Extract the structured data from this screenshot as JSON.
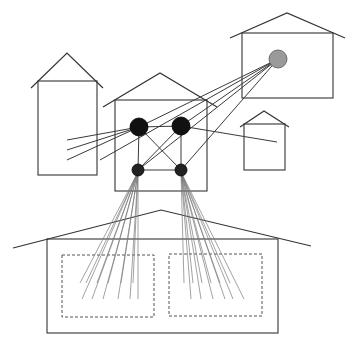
{
  "diagram": {
    "title": "Houses connected through a network hub",
    "colors": {
      "background": "#ffffff",
      "outline": "#333333",
      "link": "#3a3a3a",
      "fan": "#7a7a7a",
      "node_dark": "#111111",
      "node_small": "#222222",
      "node_gray": "#9a9a9a",
      "dashed": "#555555"
    },
    "houses": [
      {
        "id": "house-left-tall",
        "roof": [
          [
            31,
            88
          ],
          [
            67,
            53
          ],
          [
            103,
            88
          ]
        ],
        "body": {
          "x": 38,
          "y": 81,
          "w": 59,
          "h": 94
        }
      },
      {
        "id": "house-center-hub",
        "roof": [
          [
            103,
            107
          ],
          [
            160,
            73
          ],
          [
            217,
            107
          ]
        ],
        "body": {
          "x": 115,
          "y": 100,
          "w": 92,
          "h": 91
        }
      },
      {
        "id": "house-top-right",
        "roof": [
          [
            230,
            38
          ],
          [
            287,
            13
          ],
          [
            345,
            38
          ]
        ],
        "body": {
          "x": 242,
          "y": 33,
          "w": 91,
          "h": 65
        }
      },
      {
        "id": "house-small-right",
        "roof": [
          [
            240,
            127
          ],
          [
            264,
            111
          ],
          [
            289,
            127
          ]
        ],
        "body": {
          "x": 244,
          "y": 124,
          "w": 41,
          "h": 46
        }
      },
      {
        "id": "house-bottom-large",
        "roof": [
          [
            13,
            248
          ],
          [
            161,
            210
          ],
          [
            311,
            246
          ]
        ],
        "body": {
          "x": 47,
          "y": 239,
          "w": 231,
          "h": 94
        }
      }
    ],
    "rooms": [
      {
        "id": "room-left",
        "x": 62,
        "y": 255,
        "w": 92,
        "h": 62
      },
      {
        "id": "room-right",
        "x": 169,
        "y": 254,
        "w": 93,
        "h": 62
      }
    ],
    "nodes": [
      {
        "id": "hub-top-left",
        "cx": 139,
        "cy": 127,
        "r": 9,
        "kind": "dark"
      },
      {
        "id": "hub-top-right",
        "cx": 181,
        "cy": 126,
        "r": 9,
        "kind": "dark"
      },
      {
        "id": "hub-bottom-left",
        "cx": 138,
        "cy": 170,
        "r": 6,
        "kind": "small"
      },
      {
        "id": "hub-bottom-right",
        "cx": 181,
        "cy": 170,
        "r": 6,
        "kind": "small"
      },
      {
        "id": "remote-gray",
        "cx": 278,
        "cy": 59,
        "r": 9,
        "kind": "gray"
      }
    ],
    "links": [
      {
        "from": [
          139,
          127
        ],
        "to": [
          181,
          126
        ]
      },
      {
        "from": [
          139,
          127
        ],
        "to": [
          138,
          170
        ]
      },
      {
        "from": [
          181,
          126
        ],
        "to": [
          181,
          170
        ]
      },
      {
        "from": [
          138,
          170
        ],
        "to": [
          181,
          170
        ]
      },
      {
        "from": [
          139,
          127
        ],
        "to": [
          181,
          170
        ]
      },
      {
        "from": [
          181,
          126
        ],
        "to": [
          138,
          170
        ]
      },
      {
        "from": [
          139,
          127
        ],
        "to": [
          67,
          140
        ]
      },
      {
        "from": [
          139,
          127
        ],
        "to": [
          67,
          150
        ]
      },
      {
        "from": [
          139,
          127
        ],
        "to": [
          67,
          160
        ]
      },
      {
        "from": [
          181,
          126
        ],
        "to": [
          277,
          142
        ]
      },
      {
        "from": [
          278,
          59
        ],
        "to": [
          139,
          127
        ]
      },
      {
        "from": [
          278,
          59
        ],
        "to": [
          181,
          126
        ]
      },
      {
        "from": [
          278,
          59
        ],
        "to": [
          138,
          170
        ]
      },
      {
        "from": [
          278,
          59
        ],
        "to": [
          181,
          170
        ]
      },
      {
        "from": [
          278,
          59
        ],
        "to": [
          100,
          160
        ]
      }
    ],
    "fans": [
      {
        "id": "fan-left",
        "origin": [
          138,
          172
        ],
        "ends": [
          [
            80,
            283
          ],
          [
            82,
            299
          ],
          [
            86,
            283
          ],
          [
            92,
            299
          ],
          [
            97,
            283
          ],
          [
            103,
            299
          ],
          [
            108,
            283
          ],
          [
            118,
            299
          ],
          [
            121,
            283
          ],
          [
            130,
            299
          ],
          [
            133,
            283
          ],
          [
            138,
            299
          ]
        ]
      },
      {
        "id": "fan-right",
        "origin": [
          181,
          172
        ],
        "ends": [
          [
            184,
            283
          ],
          [
            191,
            299
          ],
          [
            193,
            283
          ],
          [
            201,
            299
          ],
          [
            202,
            283
          ],
          [
            213,
            299
          ],
          [
            211,
            283
          ],
          [
            225,
            299
          ],
          [
            220,
            283
          ],
          [
            233,
            299
          ],
          [
            230,
            283
          ],
          [
            244,
            299
          ]
        ]
      }
    ]
  }
}
